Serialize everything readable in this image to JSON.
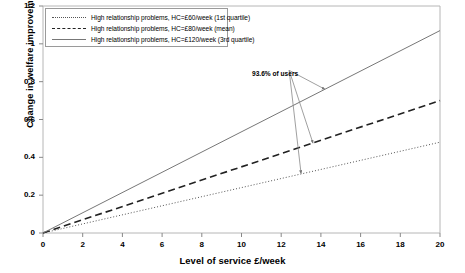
{
  "chart_data": {
    "type": "line",
    "title": "",
    "xlabel": "Level of service £/week",
    "ylabel": "Change in welfare improvement",
    "xlim": [
      0,
      20
    ],
    "ylim": [
      0,
      1.2
    ],
    "xticks": [
      "0",
      "2",
      "4",
      "6",
      "8",
      "10",
      "12",
      "14",
      "16",
      "18",
      "20"
    ],
    "yticks": [
      "0",
      "0.2",
      "0.4",
      "0.6",
      "0.8",
      "1",
      "1.2"
    ],
    "grid": false,
    "legend_position": "top-left",
    "x": [
      0,
      20
    ],
    "series": [
      {
        "name": "High relationship problems, HC=£60/week (1st quartile)",
        "style": "dotted",
        "color": "#555555",
        "values": [
          0,
          0.48
        ]
      },
      {
        "name": "High relationship problems, HC=£80/week (mean)",
        "style": "dashed",
        "color": "#222222",
        "values": [
          0,
          0.7
        ]
      },
      {
        "name": "High relationship problems, HC=£120/week (3rd quartile)",
        "style": "solid",
        "color": "#777777",
        "values": [
          0,
          1.07
        ]
      }
    ],
    "annotations": [
      {
        "text": "93.6% of users",
        "x": 12.4,
        "y": 0.86,
        "points_to": [
          {
            "x": 14.2,
            "y": 0.76
          },
          {
            "x": 13.6,
            "y": 0.475
          },
          {
            "x": 13.0,
            "y": 0.315
          }
        ]
      }
    ]
  }
}
